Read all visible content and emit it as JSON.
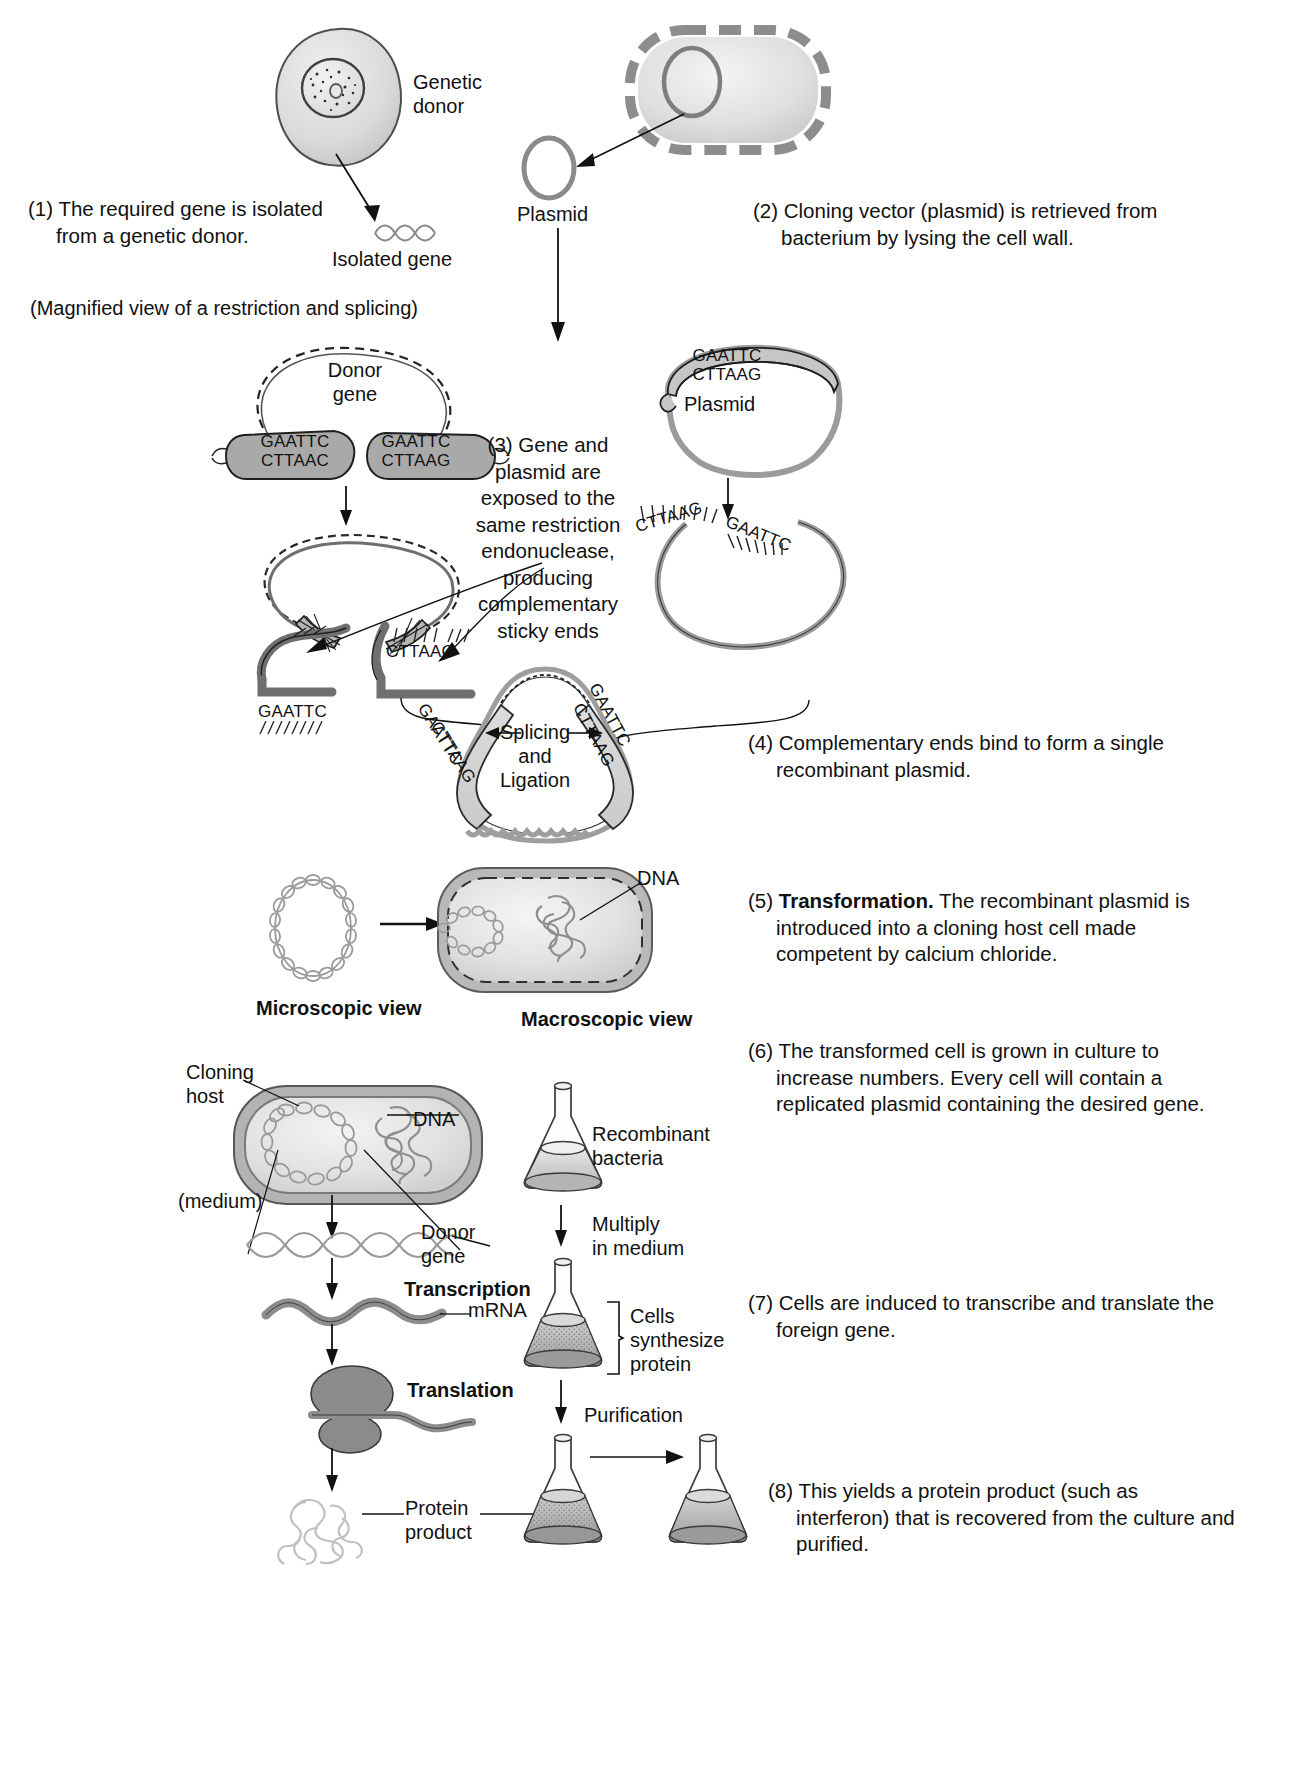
{
  "diagram": {
    "title_note": "(Magnified view of a restriction and splicing)",
    "steps": [
      {
        "num": "(1)",
        "text": "The required gene is isolated from a genetic donor."
      },
      {
        "num": "(2)",
        "text": "Cloning vector (plasmid) is retrieved from bacterium by lysing the cell wall."
      },
      {
        "num": "(3)",
        "text": "Gene and plasmid are exposed to the same restriction endonuclease, producing complementary sticky ends"
      },
      {
        "num": "(4)",
        "text": "Complementary ends bind to form a single recombinant plasmid."
      },
      {
        "num": "(5)",
        "bold_lead": "Transformation.",
        "text": "The recombinant plasmid is introduced into a cloning host cell made competent by calcium chloride."
      },
      {
        "num": "(6)",
        "text": "The transformed cell is grown in culture to increase numbers. Every cell will contain a replicated plasmid containing the desired gene."
      },
      {
        "num": "(7)",
        "text": "Cells are induced to transcribe and translate the foreign gene."
      },
      {
        "num": "(8)",
        "text": "This yields a protein product (such as interferon) that is recovered from the culture and purified."
      }
    ],
    "labels": {
      "genetic_donor": "Genetic\ndonor",
      "genetic_donor_l1": "Genetic",
      "genetic_donor_l2": "donor",
      "isolated_gene": "Isolated gene",
      "plasmid": "Plasmid",
      "donor_gene_l1": "Donor",
      "donor_gene_l2": "gene",
      "plasmid_mid": "Plasmid",
      "splicing_l1": "Splicing",
      "splicing_l2": "and",
      "splicing_l3": "Ligation",
      "dna": "DNA",
      "microscopic_view": "Microscopic view",
      "macroscopic_view": "Macroscopic view",
      "cloning_host_l1": "Cloning",
      "cloning_host_l2": "host",
      "medium": "(medium)",
      "dna2": "DNA",
      "donor_gene2_l1": "Donor",
      "donor_gene2_l2": "gene",
      "transcription": "Transcription",
      "mrna": "mRNA",
      "translation": "Translation",
      "protein_product_l1": "Protein",
      "protein_product_l2": "product",
      "recombinant_bacteria_l1": "Recombinant",
      "recombinant_bacteria_l2": "bacteria",
      "multiply_l1": "Multiply",
      "multiply_l2": "in medium",
      "cells_synth_l1": "Cells",
      "cells_synth_l2": "synthesize",
      "cells_synth_l3": "protein",
      "purification": "Purification"
    },
    "sequences": {
      "donor_left_top": "GAATTC",
      "donor_left_bottom": "CTTAAC",
      "donor_right_top": "GAATTC",
      "donor_right_bottom": "CTTAAG",
      "plasmid_top": "GAATTC",
      "plasmid_bottom": "CTTAAG",
      "cut_gene_left": "GAATTC",
      "cut_gene_right": "CTTAAC",
      "cut_plasmid_left": "CTTAAG",
      "cut_plasmid_right": "GAATTC",
      "recomb_left_top": "GAATTC",
      "recomb_left_bottom": "CTTAAG",
      "recomb_right_top": "GAATTC",
      "recomb_right_bottom": "CTTAAG"
    },
    "colors": {
      "ink": "#1a1a1a",
      "cell_fill": "#dcdcdc",
      "cell_stroke": "#555555",
      "plasmid_stroke": "#777777",
      "strand_fill": "#b8b8b8",
      "ribosome": "#8f8f8f",
      "flask_stroke": "#333333",
      "medium_light": "#d8d8d8",
      "medium_dark": "#9e9e9e"
    }
  }
}
